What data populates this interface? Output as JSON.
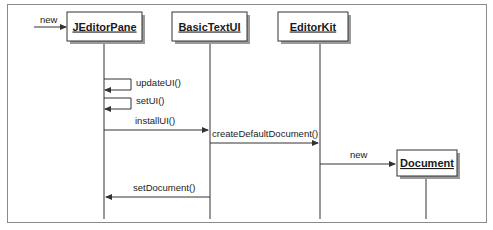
{
  "diagram": {
    "type": "uml-sequence",
    "colors": {
      "line": "#333333",
      "box_border": "#333333",
      "box_shadow": "#9a9a9a",
      "frame": "#8a8a8a"
    },
    "objects": [
      {
        "id": "jeditorpane",
        "label": "JEditorPane",
        "x": 104,
        "y": 7,
        "w": 70,
        "h": 26,
        "lifeline_x": 104,
        "lifeline_end": 218
      },
      {
        "id": "basictextui",
        "label": "BasicTextUI",
        "x": 172,
        "y": 7,
        "w": 72,
        "h": 26,
        "lifeline_x": 208,
        "lifeline_end": 218
      },
      {
        "id": "editorkit",
        "label": "EditorKit",
        "x": 280,
        "y": 7,
        "w": 70,
        "h": 26,
        "lifeline_x": 320,
        "lifeline_end": 218
      },
      {
        "id": "document",
        "label": "Document",
        "x": 396,
        "y": 152,
        "w": 60,
        "h": 26,
        "lifeline_x": 426,
        "lifeline_end": 218
      }
    ],
    "messages": [
      {
        "label": "new",
        "kind": "create-entry",
        "from_x": 34,
        "to_x": 66,
        "y": 27
      },
      {
        "label": "updateUI()",
        "kind": "self",
        "x": 104,
        "y1": 78,
        "y2": 90
      },
      {
        "label": "setUI()",
        "kind": "self",
        "x": 104,
        "y1": 97,
        "y2": 109
      },
      {
        "label": "installUI()",
        "kind": "call",
        "from_x": 104,
        "to_x": 208,
        "y": 130
      },
      {
        "label": "createDefaultDocument()",
        "kind": "call",
        "from_x": 208,
        "to_x": 320,
        "y": 143
      },
      {
        "label": "new",
        "kind": "create",
        "from_x": 320,
        "to_x": 396,
        "y": 165
      },
      {
        "label": "setDocument()",
        "kind": "return",
        "from_x": 208,
        "to_x": 104,
        "y": 197
      }
    ]
  }
}
